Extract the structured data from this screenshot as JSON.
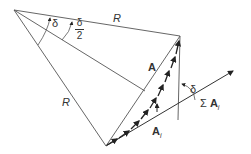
{
  "diagram": {
    "labels": {
      "radius_top": "R",
      "radius_left": "R",
      "angle_delta": "δ",
      "angle_half_num": "δ",
      "angle_half_den": "2",
      "chord": "A",
      "angle_delta_right": "δ",
      "sum_sigma": "Σ",
      "sum_vector": "A",
      "sum_sub": "i",
      "element_vector": "A",
      "element_sub": "i"
    },
    "colors": {
      "line": "#555555",
      "arrow": "#222222",
      "background": "#ffffff"
    }
  }
}
